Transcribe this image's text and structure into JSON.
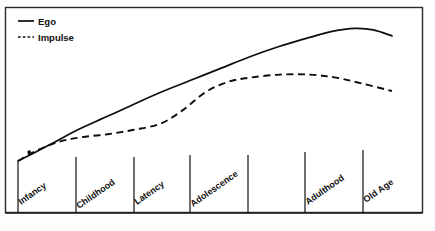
{
  "chart_data": {
    "type": "line",
    "title": "",
    "subtitle": "",
    "xlabel": "",
    "ylabel": "",
    "grid": false,
    "legend_position": "top-left",
    "categories": [
      "Infancy",
      "Childhood",
      "Latency",
      "Adolescence",
      "",
      "Adulthood",
      "Old Age"
    ],
    "tick_labels": [
      {
        "label": "Infancy",
        "x": 18
      },
      {
        "label": "Childhood",
        "x": 76
      },
      {
        "label": "Latency",
        "x": 134
      },
      {
        "label": "Adolescence",
        "x": 190
      },
      {
        "label": "",
        "x": 248
      },
      {
        "label": "Adulthood",
        "x": 305
      },
      {
        "label": "Old Age",
        "x": 363
      }
    ],
    "xlim": [
      0,
      100
    ],
    "ylim": [
      0,
      100
    ],
    "series": [
      {
        "name": "Ego",
        "style": "solid",
        "color": "#0d0d0d",
        "x": [
          0,
          4,
          10,
          16,
          23,
          30,
          38,
          46,
          54,
          62,
          70,
          78,
          84,
          90,
          95,
          100
        ],
        "values": [
          4,
          9,
          17,
          25,
          33,
          41,
          50,
          58,
          66,
          74,
          81,
          87,
          91,
          93,
          92,
          88
        ]
      },
      {
        "name": "Impulse",
        "style": "dashed",
        "color": "#0d0d0d",
        "x": [
          0,
          5,
          11,
          17,
          24,
          31,
          38,
          44,
          50,
          56,
          62,
          70,
          78,
          85,
          92,
          100
        ],
        "values": [
          4,
          11,
          17,
          20,
          22,
          25,
          29,
          38,
          50,
          57,
          60,
          62,
          62,
          60,
          56,
          51
        ]
      }
    ],
    "annotations": [
      {
        "type": "point-marker",
        "name": "origin-dot",
        "x": 3,
        "y": 10
      }
    ]
  },
  "legend": {
    "items": [
      {
        "label": "Ego",
        "style": "solid"
      },
      {
        "label": "Impulse",
        "style": "dashed"
      }
    ]
  },
  "figure": {
    "background": "#ffffff",
    "border_color": "#2a2a2a",
    "line_color": "#0d0d0d"
  }
}
